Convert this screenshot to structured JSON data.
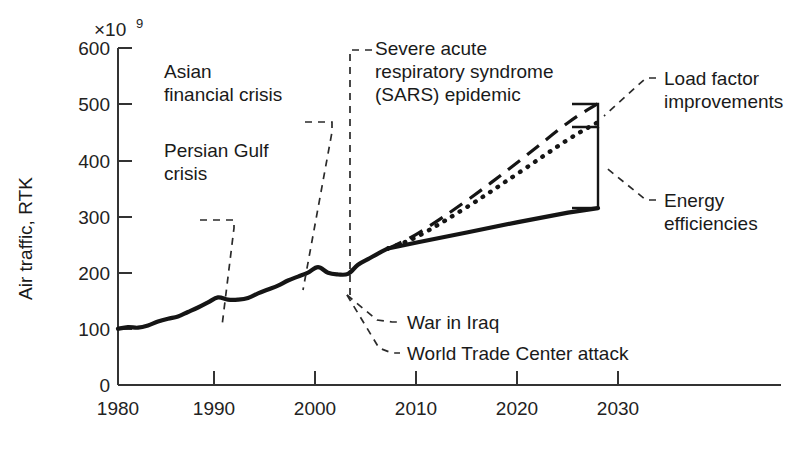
{
  "chart_data": {
    "type": "line",
    "title": "",
    "xlabel": "",
    "ylabel": "Air traffic, RTK",
    "y_multiplier_label": "×10",
    "y_multiplier_exponent": "9",
    "xlim": [
      1980,
      2038
    ],
    "ylim": [
      0,
      600
    ],
    "grid": false,
    "legend_position": "none",
    "x_ticks": [
      1980,
      1990,
      2000,
      2010,
      2020,
      2030
    ],
    "x_tick_labels": [
      "1980",
      "1990",
      "2000",
      "2010",
      "2020",
      "2030"
    ],
    "y_ticks": [
      0,
      100,
      200,
      300,
      400,
      500,
      600
    ],
    "y_tick_labels": [
      "0",
      "100",
      "200",
      "300",
      "400",
      "500",
      "600"
    ],
    "series": [
      {
        "name": "Historical air traffic",
        "style": "solid-thick",
        "x": [
          1980,
          1981,
          1982,
          1983,
          1984,
          1985,
          1986,
          1987,
          1988,
          1989,
          1990,
          1991,
          1992,
          1993,
          1994,
          1995,
          1996,
          1997,
          1998,
          1999,
          2000,
          2001,
          2002,
          2003,
          2004,
          2005,
          2006,
          2007
        ],
        "values": [
          100,
          103,
          102,
          106,
          113,
          118,
          122,
          130,
          138,
          147,
          156,
          152,
          152,
          155,
          163,
          170,
          177,
          186,
          193,
          200,
          210,
          200,
          197,
          198,
          214,
          224,
          234,
          243
        ]
      },
      {
        "name": "Baseline projection",
        "style": "solid-thick",
        "x": [
          2007,
          2010,
          2015,
          2020,
          2025,
          2028
        ],
        "values": [
          243,
          254,
          272,
          290,
          307,
          315
        ]
      },
      {
        "name": "Projection with energy efficiencies",
        "style": "dotted",
        "x": [
          2007,
          2010,
          2015,
          2020,
          2025,
          2028
        ],
        "values": [
          243,
          265,
          318,
          377,
          437,
          468
        ]
      },
      {
        "name": "Unconstrained growth projection",
        "style": "dashed",
        "x": [
          2007,
          2010,
          2015,
          2020,
          2025,
          2028
        ],
        "values": [
          243,
          270,
          330,
          397,
          467,
          501
        ]
      }
    ],
    "annotations": [
      {
        "label": "Persian Gulf crisis",
        "target_x": 1991,
        "target_y": 152
      },
      {
        "label": "Asian financial crisis",
        "target_x": 1998,
        "target_y": 193
      },
      {
        "label": "Severe acute respiratory syndrome (SARS) epidemic",
        "target_x": 2003,
        "target_y": 198
      },
      {
        "label": "War in Iraq",
        "target_x": 2003,
        "target_y": 198
      },
      {
        "label": "World Trade Center attack",
        "target_x": 2001,
        "target_y": 200
      },
      {
        "label": "Load factor improvements",
        "bracket": "top"
      },
      {
        "label": "Energy efficiencies",
        "bracket": "bottom"
      }
    ]
  },
  "axes": {
    "y_title": "Air traffic, RTK",
    "y_multiplier": "×10",
    "y_multiplier_exp": "9",
    "y_tick_labels": [
      "600",
      "500",
      "400",
      "300",
      "200",
      "100",
      "0"
    ],
    "x_tick_labels": [
      "1980",
      "1990",
      "2000",
      "2010",
      "2020",
      "2030"
    ]
  },
  "annotation_text": {
    "persian_gulf_l1": "Persian Gulf",
    "persian_gulf_l2": "crisis",
    "asian_crisis_l1": "Asian",
    "asian_crisis_l2": "financial crisis",
    "sars_l1": "Severe acute",
    "sars_l2": "respiratory syndrome",
    "sars_l3": "(SARS) epidemic",
    "war_iraq": "War in Iraq",
    "wtc_attack": "World Trade Center attack",
    "load_factor_l1": "Load factor",
    "load_factor_l2": "improvements",
    "energy_l1": "Energy",
    "energy_l2": "efficiencies"
  },
  "colors": {
    "ink": "#1a1a1a",
    "axis": "#333333",
    "background": "#ffffff"
  }
}
